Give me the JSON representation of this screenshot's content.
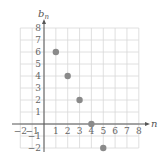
{
  "chart_data": {
    "type": "scatter",
    "title": "",
    "xlabel": "n",
    "ylabel": "b_n",
    "ylabel_main": "b",
    "ylabel_sub": "n",
    "xlim": [
      -2,
      8
    ],
    "ylim": [
      -2,
      8
    ],
    "grid": true,
    "legend": null,
    "x_ticks": [
      "-2",
      "-1",
      "1",
      "2",
      "3",
      "4",
      "5",
      "6",
      "7",
      "8"
    ],
    "y_ticks": [
      "8",
      "7",
      "6",
      "5",
      "4",
      "3",
      "2",
      "1",
      "-1",
      "-2"
    ],
    "series": [
      {
        "name": "b_n",
        "x": [
          1,
          2,
          3,
          4,
          5
        ],
        "y": [
          6,
          4,
          2,
          0,
          -2
        ]
      }
    ],
    "colors": {
      "points": "#8a8a8a",
      "grid": "#d8d8d8",
      "axes": "#555555"
    }
  }
}
